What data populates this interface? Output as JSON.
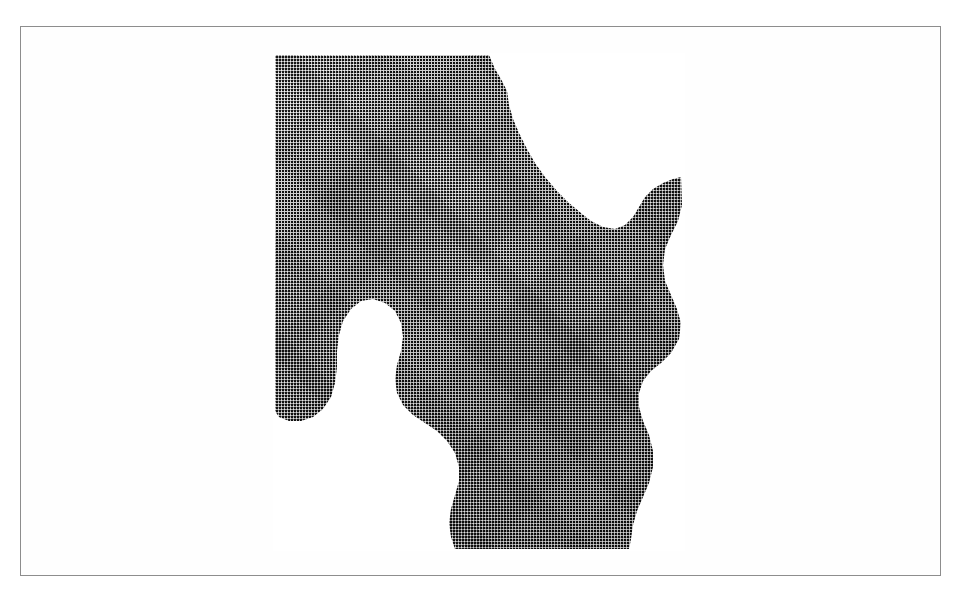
{
  "page": {
    "background_color": "#ffffff",
    "width": 960,
    "height": 598
  },
  "frame": {
    "name": "figure-border",
    "border_color": "#8d8d8d",
    "border_width_px": 1,
    "x": 20,
    "y": 26,
    "width": 921,
    "height": 550,
    "fill_color": "#fefefe"
  },
  "figure": {
    "kind": "halftone-photograph",
    "caption": "",
    "label": "",
    "rendering": "black-and-white halftone dot screen (newsprint style)",
    "silhouette": "irregular cut-out: rectangular upper-left block with stepped right edge, large white notch below centre-left, shaft descending to lower right",
    "plate": {
      "x": 272,
      "y": 52,
      "width": 412,
      "height": 498
    },
    "tones": {
      "lightest": "#b4b4b4",
      "midtone": "#7a7a7a",
      "darkest": "#3c3c3c",
      "paper": "#ffffff",
      "ink": "#000000"
    },
    "anatomy_regions": [
      {
        "name": "acetabular-roof",
        "tone": "light"
      },
      {
        "name": "femoral-head",
        "tone": "light"
      },
      {
        "name": "acetabular-fossa-shadow",
        "tone": "dark"
      },
      {
        "name": "femoral-neck",
        "tone": "midtone"
      },
      {
        "name": "greater-trochanter",
        "tone": "midtone"
      },
      {
        "name": "intertrochanteric-region",
        "tone": "dark"
      },
      {
        "name": "femoral-shaft",
        "tone": "dark"
      },
      {
        "name": "ischium-strip",
        "tone": "midtone"
      },
      {
        "name": "obturator-notch-cutout",
        "tone": "paper"
      }
    ]
  }
}
